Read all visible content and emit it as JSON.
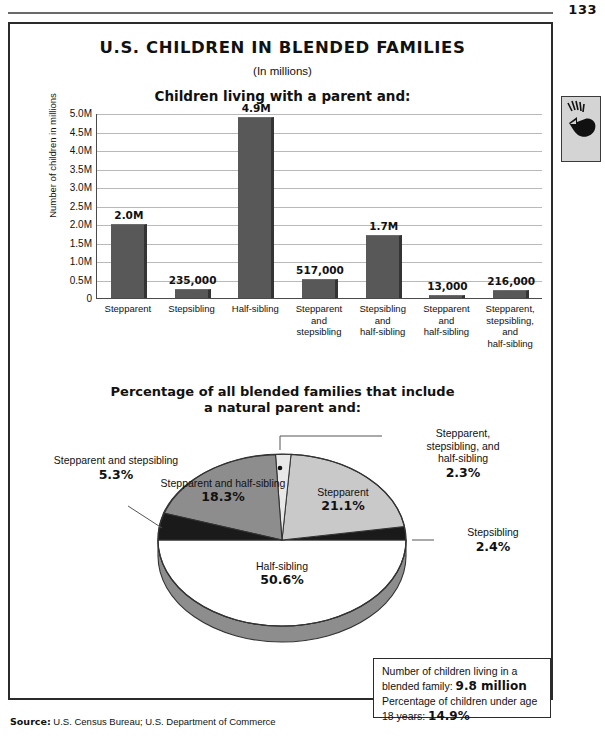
{
  "page": {
    "folio": "133"
  },
  "header": {
    "title": "U.S. CHILDREN IN BLENDED FAMILIES",
    "subtitle": "(In millions)"
  },
  "bar_section": {
    "heading": "Children living with a parent and:"
  },
  "pie_section": {
    "heading_line1": "Percentage of all blended families that include",
    "heading_line2": "a natural parent and:"
  },
  "fact_box": {
    "row1_text": "Number of children living in a blended family: ",
    "row1_value": "9.8 million",
    "row2_text": "Percentage of children under age 18 years: ",
    "row2_value": "14.9%"
  },
  "source": {
    "label": "Source:",
    "text": "U.S. Census Bureau; U.S. Department of Commerce"
  },
  "chart_data": [
    {
      "type": "bar",
      "title": "Children living with a parent and:",
      "xlabel": "",
      "ylabel": "Number of children in millions",
      "ylim": [
        0,
        5000000
      ],
      "yticks": [
        "0",
        "0.5M",
        "1.0M",
        "1.5M",
        "2.0M",
        "2.5M",
        "3.0M",
        "3.5M",
        "4.0M",
        "4.5M",
        "5.0M"
      ],
      "grid": true,
      "categories": [
        "Stepparent",
        "Stepsibling",
        "Half-sibling",
        "Stepparent and stepsibling",
        "Stepsibling and half-sibling",
        "Stepparent and half-sibling",
        "Stepparent, stepsibling, and half-sibling"
      ],
      "category_lines": [
        [
          "Stepparent"
        ],
        [
          "Stepsibling"
        ],
        [
          "Half-sibling"
        ],
        [
          "Stepparent",
          "and",
          "stepsibling"
        ],
        [
          "Stepsibling",
          "and",
          "half-sibling"
        ],
        [
          "Stepparent",
          "and",
          "half-sibling"
        ],
        [
          "Stepparent,",
          "stepsibling,",
          "and",
          "half-sibling"
        ]
      ],
      "values": [
        2000000,
        235000,
        4900000,
        517000,
        1700000,
        13000,
        216000
      ],
      "data_labels": [
        "2.0M",
        "235,000",
        "4.9M",
        "517,000",
        "1.7M",
        "13,000",
        "216,000"
      ],
      "bar_color": "#585858"
    },
    {
      "type": "pie",
      "title": "Percentage of all blended families that include a natural parent and:",
      "labels": [
        "Stepparent",
        "Stepsibling",
        "Half-sibling",
        "Stepparent and stepsibling",
        "Stepparent and half-sibling",
        "Stepparent, stepsibling, and half-sibling"
      ],
      "values": [
        21.1,
        2.4,
        50.6,
        5.3,
        18.3,
        2.3
      ],
      "value_labels": [
        "21.1%",
        "2.4%",
        "50.6%",
        "5.3%",
        "18.3%",
        "2.3%"
      ],
      "slice_colors": [
        "#c9c9c9",
        "#1a1a1a",
        "#ffffff",
        "#1a1a1a",
        "#8d8d8d",
        "#e2e2e2"
      ]
    }
  ],
  "pie_labels": {
    "stepparent_stepsibling": {
      "name": "Stepparent and stepsibling",
      "pct": "5.3%"
    },
    "stepparent_halfsibling": {
      "name": "Stepparent and half-sibling",
      "pct": "18.3%"
    },
    "stepparent": {
      "name": "Stepparent",
      "pct": "21.1%"
    },
    "halfsibling": {
      "name": "Half-sibling",
      "pct": "50.6%"
    },
    "stepsibling": {
      "name": "Stepsibling",
      "pct": "2.4%"
    },
    "all_three": {
      "name_line1": "Stepparent,",
      "name_line2": "stepsibling, and",
      "name_line3": "half-sibling",
      "pct": "2.3%"
    }
  }
}
